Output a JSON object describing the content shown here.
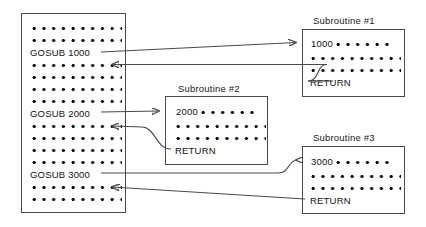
{
  "diagram": {
    "stroke_color": "#4a4a4a",
    "text_color": "#111111",
    "background": "#ffffff"
  },
  "main_program": {
    "name": "main-program",
    "lines": [
      {
        "type": "dots",
        "count": 10
      },
      {
        "type": "dots",
        "count": 10
      },
      {
        "type": "text",
        "text": "GOSUB 1000"
      },
      {
        "type": "dots",
        "count": 10
      },
      {
        "type": "dots",
        "count": 10
      },
      {
        "type": "dots",
        "count": 10
      },
      {
        "type": "dots",
        "count": 10
      },
      {
        "type": "text",
        "text": "GOSUB 2000"
      },
      {
        "type": "dots",
        "count": 10
      },
      {
        "type": "dots",
        "count": 10
      },
      {
        "type": "dots",
        "count": 10
      },
      {
        "type": "dots",
        "count": 10
      },
      {
        "type": "text",
        "text": "GOSUB 3000"
      },
      {
        "type": "dots",
        "count": 10
      },
      {
        "type": "dots",
        "count": 10
      }
    ],
    "gosub_labels": [
      "GOSUB 1000",
      "GOSUB 2000",
      "GOSUB 3000"
    ]
  },
  "subroutines": [
    {
      "caption": "Subroutine  #1",
      "entry_line": "1000",
      "entry_dots": 6,
      "body_dot_rows": [
        10,
        10
      ],
      "return_label": "RETURN"
    },
    {
      "caption": "Subroutine  #2",
      "entry_line": "2000",
      "entry_dots": 6,
      "body_dot_rows": [
        10,
        10
      ],
      "return_label": "RETURN"
    },
    {
      "caption": "Subroutine  #3",
      "entry_line": "3000",
      "entry_dots": 6,
      "body_dot_rows": [
        10,
        10
      ],
      "return_label": "RETURN"
    }
  ]
}
